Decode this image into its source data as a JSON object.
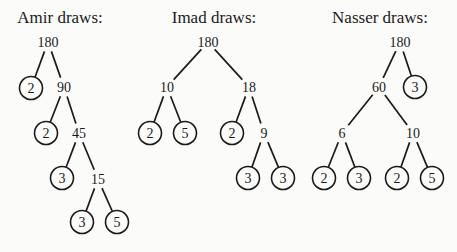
{
  "trees": [
    {
      "title": "Amir draws:",
      "title_pos": [
        60,
        23
      ],
      "nodes": [
        {
          "id": "a0",
          "label": "180",
          "x": 48,
          "y": 42,
          "prime": false
        },
        {
          "id": "a1",
          "label": "2",
          "x": 31,
          "y": 88,
          "prime": true
        },
        {
          "id": "a2",
          "label": "90",
          "x": 64,
          "y": 87,
          "prime": false
        },
        {
          "id": "a3",
          "label": "2",
          "x": 46,
          "y": 133,
          "prime": true
        },
        {
          "id": "a4",
          "label": "45",
          "x": 79,
          "y": 133,
          "prime": false
        },
        {
          "id": "a5",
          "label": "3",
          "x": 62,
          "y": 178,
          "prime": true
        },
        {
          "id": "a6",
          "label": "15",
          "x": 98,
          "y": 179,
          "prime": false
        },
        {
          "id": "a7",
          "label": "3",
          "x": 82,
          "y": 222,
          "prime": true
        },
        {
          "id": "a8",
          "label": "5",
          "x": 117,
          "y": 222,
          "prime": true
        }
      ],
      "edges": [
        [
          "a0",
          "a1"
        ],
        [
          "a0",
          "a2"
        ],
        [
          "a2",
          "a3"
        ],
        [
          "a2",
          "a4"
        ],
        [
          "a4",
          "a5"
        ],
        [
          "a4",
          "a6"
        ],
        [
          "a6",
          "a7"
        ],
        [
          "a6",
          "a8"
        ]
      ]
    },
    {
      "title": "Imad draws:",
      "title_pos": [
        214,
        23
      ],
      "nodes": [
        {
          "id": "b0",
          "label": "180",
          "x": 208,
          "y": 42,
          "prime": false
        },
        {
          "id": "b1",
          "label": "10",
          "x": 167,
          "y": 87,
          "prime": false
        },
        {
          "id": "b2",
          "label": "18",
          "x": 249,
          "y": 87,
          "prime": false
        },
        {
          "id": "b3",
          "label": "2",
          "x": 150,
          "y": 133,
          "prime": true
        },
        {
          "id": "b4",
          "label": "5",
          "x": 185,
          "y": 133,
          "prime": true
        },
        {
          "id": "b5",
          "label": "2",
          "x": 232,
          "y": 133,
          "prime": true
        },
        {
          "id": "b6",
          "label": "9",
          "x": 264,
          "y": 133,
          "prime": false
        },
        {
          "id": "b7",
          "label": "3",
          "x": 248,
          "y": 178,
          "prime": true
        },
        {
          "id": "b8",
          "label": "3",
          "x": 283,
          "y": 178,
          "prime": true
        }
      ],
      "edges": [
        [
          "b0",
          "b1"
        ],
        [
          "b0",
          "b2"
        ],
        [
          "b1",
          "b3"
        ],
        [
          "b1",
          "b4"
        ],
        [
          "b2",
          "b5"
        ],
        [
          "b2",
          "b6"
        ],
        [
          "b6",
          "b7"
        ],
        [
          "b6",
          "b8"
        ]
      ]
    },
    {
      "title": "Nasser draws:",
      "title_pos": [
        380,
        23
      ],
      "nodes": [
        {
          "id": "c0",
          "label": "180",
          "x": 400,
          "y": 42,
          "prime": false
        },
        {
          "id": "c1",
          "label": "60",
          "x": 379,
          "y": 87,
          "prime": false
        },
        {
          "id": "c2",
          "label": "3",
          "x": 415,
          "y": 87,
          "prime": true
        },
        {
          "id": "c3",
          "label": "6",
          "x": 342,
          "y": 133,
          "prime": false
        },
        {
          "id": "c4",
          "label": "10",
          "x": 413,
          "y": 133,
          "prime": false
        },
        {
          "id": "c5",
          "label": "2",
          "x": 324,
          "y": 178,
          "prime": true
        },
        {
          "id": "c6",
          "label": "3",
          "x": 359,
          "y": 178,
          "prime": true
        },
        {
          "id": "c7",
          "label": "2",
          "x": 397,
          "y": 178,
          "prime": true
        },
        {
          "id": "c8",
          "label": "5",
          "x": 432,
          "y": 178,
          "prime": true
        }
      ],
      "edges": [
        [
          "c0",
          "c1"
        ],
        [
          "c0",
          "c2"
        ],
        [
          "c1",
          "c3"
        ],
        [
          "c1",
          "c4"
        ],
        [
          "c3",
          "c5"
        ],
        [
          "c3",
          "c6"
        ],
        [
          "c4",
          "c7"
        ],
        [
          "c4",
          "c8"
        ]
      ]
    }
  ],
  "style": {
    "ink": "#1a1a1a",
    "background": "#fbfbfa",
    "circle_radius": 11.5
  }
}
